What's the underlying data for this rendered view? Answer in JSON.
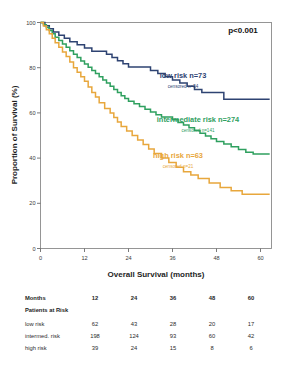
{
  "figure": {
    "annotation_pvalue": "p<0.001"
  },
  "chart_data": {
    "type": "line",
    "title": "",
    "xlabel": "Overall Survival (months)",
    "ylabel": "Proportion of Survival (%)",
    "xlim": [
      0,
      63
    ],
    "ylim": [
      0,
      100
    ],
    "xticks": [
      0,
      12,
      24,
      36,
      48,
      60
    ],
    "xticklabels": [
      "0",
      "12",
      "24",
      "36",
      "48",
      "60"
    ],
    "yticks": [
      0,
      20,
      40,
      60,
      80,
      100
    ],
    "yticklabels": [
      "0",
      "20",
      "40",
      "60",
      "80",
      "100"
    ],
    "grid": false,
    "legend_position": "inside-right",
    "annotations": [
      "p<0.001"
    ],
    "series": [
      {
        "name": "low risk",
        "label": "low risk n=73",
        "censored_label": "censored n=54",
        "n": 73,
        "censored": 54,
        "color": "#2e4372",
        "points": [
          [
            0,
            100
          ],
          [
            1.2,
            100
          ],
          [
            1.2,
            98.6
          ],
          [
            2.4,
            98.6
          ],
          [
            2.4,
            97.2
          ],
          [
            3.5,
            97.2
          ],
          [
            3.5,
            95.8
          ],
          [
            5.0,
            95.8
          ],
          [
            5.0,
            94.4
          ],
          [
            6.5,
            94.4
          ],
          [
            6.5,
            93.0
          ],
          [
            8.0,
            93.0
          ],
          [
            8.0,
            91.5
          ],
          [
            10.0,
            91.5
          ],
          [
            10.0,
            90.1
          ],
          [
            12.0,
            90.1
          ],
          [
            12.0,
            88.7
          ],
          [
            14.0,
            88.7
          ],
          [
            14.0,
            87.3
          ],
          [
            16.5,
            87.3
          ],
          [
            16.5,
            87.3
          ],
          [
            18.0,
            87.3
          ],
          [
            18.0,
            85.9
          ],
          [
            19.5,
            85.9
          ],
          [
            19.5,
            84.5
          ],
          [
            21.0,
            84.5
          ],
          [
            21.0,
            83.1
          ],
          [
            22.5,
            83.1
          ],
          [
            22.5,
            81.7
          ],
          [
            24.0,
            81.7
          ],
          [
            24.0,
            80.3
          ],
          [
            27.0,
            80.3
          ],
          [
            27.0,
            80.3
          ],
          [
            30.0,
            80.3
          ],
          [
            30.0,
            78.8
          ],
          [
            32.0,
            78.8
          ],
          [
            32.0,
            77.4
          ],
          [
            34.0,
            77.4
          ],
          [
            34.0,
            76.0
          ],
          [
            36.0,
            76.0
          ],
          [
            36.0,
            74.6
          ],
          [
            38.0,
            74.6
          ],
          [
            38.0,
            73.2
          ],
          [
            40.0,
            73.2
          ],
          [
            40.0,
            71.8
          ],
          [
            42.0,
            71.8
          ],
          [
            42.0,
            70.4
          ],
          [
            44.0,
            70.4
          ],
          [
            44.0,
            69.0
          ],
          [
            50.0,
            69.0
          ],
          [
            50.0,
            66.0
          ],
          [
            62.5,
            66.0
          ]
        ]
      },
      {
        "name": "intermediate risk",
        "label": "intermediate risk n=274",
        "censored_label": "censored n=141",
        "n": 274,
        "censored": 141,
        "color": "#2fa05f",
        "points": [
          [
            0,
            100
          ],
          [
            0.8,
            100
          ],
          [
            0.8,
            99.0
          ],
          [
            1.6,
            99.0
          ],
          [
            1.6,
            97.8
          ],
          [
            2.4,
            97.8
          ],
          [
            2.4,
            96.5
          ],
          [
            3.2,
            96.5
          ],
          [
            3.2,
            95.0
          ],
          [
            4.0,
            95.0
          ],
          [
            4.0,
            93.5
          ],
          [
            5.0,
            93.5
          ],
          [
            5.0,
            92.0
          ],
          [
            6.0,
            92.0
          ],
          [
            6.0,
            90.5
          ],
          [
            7.0,
            90.5
          ],
          [
            7.0,
            89.0
          ],
          [
            8.0,
            89.0
          ],
          [
            8.0,
            87.5
          ],
          [
            9.0,
            87.5
          ],
          [
            9.0,
            86.0
          ],
          [
            10.0,
            86.0
          ],
          [
            10.0,
            84.5
          ],
          [
            11.0,
            84.5
          ],
          [
            11.0,
            83.0
          ],
          [
            12.0,
            83.0
          ],
          [
            12.0,
            81.6
          ],
          [
            13.0,
            81.6
          ],
          [
            13.0,
            80.2
          ],
          [
            14.0,
            80.2
          ],
          [
            14.0,
            78.8
          ],
          [
            15.0,
            78.8
          ],
          [
            15.0,
            77.4
          ],
          [
            16.0,
            77.4
          ],
          [
            16.0,
            76.0
          ],
          [
            17.0,
            76.0
          ],
          [
            17.0,
            74.6
          ],
          [
            18.0,
            74.6
          ],
          [
            18.0,
            73.2
          ],
          [
            19.0,
            73.2
          ],
          [
            19.0,
            71.8
          ],
          [
            20.0,
            71.8
          ],
          [
            20.0,
            70.4
          ],
          [
            21.0,
            70.4
          ],
          [
            21.0,
            69.0
          ],
          [
            22.0,
            69.0
          ],
          [
            22.0,
            67.6
          ],
          [
            23.0,
            67.6
          ],
          [
            23.0,
            66.4
          ],
          [
            24.0,
            66.4
          ],
          [
            24.0,
            65.2
          ],
          [
            25.5,
            65.2
          ],
          [
            25.5,
            64.0
          ],
          [
            27.0,
            64.0
          ],
          [
            27.0,
            62.8
          ],
          [
            28.5,
            62.8
          ],
          [
            28.5,
            61.6
          ],
          [
            30.0,
            61.6
          ],
          [
            30.0,
            60.4
          ],
          [
            31.5,
            60.4
          ],
          [
            31.5,
            59.2
          ],
          [
            33.0,
            59.2
          ],
          [
            33.0,
            58.2
          ],
          [
            36.0,
            58.2
          ],
          [
            36.0,
            57.0
          ],
          [
            37.5,
            57.0
          ],
          [
            37.5,
            55.8
          ],
          [
            39.0,
            55.8
          ],
          [
            39.0,
            54.6
          ],
          [
            40.5,
            54.6
          ],
          [
            40.5,
            53.4
          ],
          [
            42.0,
            53.4
          ],
          [
            42.0,
            52.2
          ],
          [
            43.5,
            52.2
          ],
          [
            43.5,
            51.0
          ],
          [
            45.0,
            51.0
          ],
          [
            45.0,
            49.8
          ],
          [
            46.5,
            49.8
          ],
          [
            46.5,
            48.6
          ],
          [
            48.0,
            48.6
          ],
          [
            48.0,
            47.4
          ],
          [
            50.0,
            47.4
          ],
          [
            50.0,
            46.2
          ],
          [
            52.0,
            46.2
          ],
          [
            52.0,
            45.0
          ],
          [
            54.0,
            45.0
          ],
          [
            54.0,
            43.8
          ],
          [
            56.0,
            43.8
          ],
          [
            56.0,
            42.6
          ],
          [
            58.0,
            42.6
          ],
          [
            58.0,
            41.8
          ],
          [
            62.5,
            41.8
          ]
        ]
      },
      {
        "name": "high risk",
        "label": "high risk n=63",
        "censored_label": "censored n=21",
        "n": 63,
        "censored": 21,
        "color": "#e8a73c",
        "points": [
          [
            0,
            100
          ],
          [
            0.8,
            100
          ],
          [
            0.8,
            98.4
          ],
          [
            1.6,
            98.4
          ],
          [
            1.6,
            96.8
          ],
          [
            2.4,
            96.8
          ],
          [
            2.4,
            95.0
          ],
          [
            3.2,
            95.0
          ],
          [
            3.2,
            93.0
          ],
          [
            4.0,
            93.0
          ],
          [
            4.0,
            91.0
          ],
          [
            5.0,
            91.0
          ],
          [
            5.0,
            89.0
          ],
          [
            6.0,
            89.0
          ],
          [
            6.0,
            87.0
          ],
          [
            7.0,
            87.0
          ],
          [
            7.0,
            85.0
          ],
          [
            8.0,
            85.0
          ],
          [
            8.0,
            82.5
          ],
          [
            9.0,
            82.5
          ],
          [
            9.0,
            80.0
          ],
          [
            10.0,
            80.0
          ],
          [
            10.0,
            78.0
          ],
          [
            11.0,
            78.0
          ],
          [
            11.0,
            76.0
          ],
          [
            12.0,
            76.0
          ],
          [
            12.0,
            74.0
          ],
          [
            13.0,
            74.0
          ],
          [
            13.0,
            71.5
          ],
          [
            14.0,
            71.5
          ],
          [
            14.0,
            69.0
          ],
          [
            15.0,
            69.0
          ],
          [
            15.0,
            67.0
          ],
          [
            16.0,
            67.0
          ],
          [
            16.0,
            64.5
          ],
          [
            17.5,
            64.5
          ],
          [
            17.5,
            62.0
          ],
          [
            19.0,
            62.0
          ],
          [
            19.0,
            60.0
          ],
          [
            20.0,
            60.0
          ],
          [
            20.0,
            58.0
          ],
          [
            21.0,
            58.0
          ],
          [
            21.0,
            56.0
          ],
          [
            22.0,
            56.0
          ],
          [
            22.0,
            54.0
          ],
          [
            23.5,
            54.0
          ],
          [
            23.5,
            52.0
          ],
          [
            25.0,
            52.0
          ],
          [
            25.0,
            50.0
          ],
          [
            26.5,
            50.0
          ],
          [
            26.5,
            48.0
          ],
          [
            28.0,
            48.0
          ],
          [
            28.0,
            46.0
          ],
          [
            29.5,
            46.0
          ],
          [
            29.5,
            44.0
          ],
          [
            31.0,
            44.0
          ],
          [
            31.0,
            42.0
          ],
          [
            33.0,
            42.0
          ],
          [
            33.0,
            40.0
          ],
          [
            35.0,
            40.0
          ],
          [
            35.0,
            38.0
          ],
          [
            37.0,
            38.0
          ],
          [
            37.0,
            36.0
          ],
          [
            39.0,
            36.0
          ],
          [
            39.0,
            34.0
          ],
          [
            41.0,
            34.0
          ],
          [
            41.0,
            32.5
          ],
          [
            43.0,
            32.5
          ],
          [
            43.0,
            31.0
          ],
          [
            46.0,
            31.0
          ],
          [
            46.0,
            29.0
          ],
          [
            49.0,
            29.0
          ],
          [
            49.0,
            27.0
          ],
          [
            52.0,
            27.0
          ],
          [
            52.0,
            25.5
          ],
          [
            55.0,
            25.5
          ],
          [
            55.0,
            24.0
          ],
          [
            62.5,
            24.0
          ]
        ]
      }
    ]
  },
  "risk_table": {
    "header_label": "Months",
    "subheader_label": "Patients at Risk",
    "columns": [
      "12",
      "24",
      "36",
      "48",
      "60"
    ],
    "rows": [
      {
        "label": "low risk",
        "values": [
          "62",
          "43",
          "28",
          "20",
          "17"
        ]
      },
      {
        "label": "intermed. risk",
        "values": [
          "198",
          "124",
          "93",
          "60",
          "42"
        ]
      },
      {
        "label": "high risk",
        "values": [
          "39",
          "24",
          "15",
          "8",
          "6"
        ]
      }
    ]
  }
}
